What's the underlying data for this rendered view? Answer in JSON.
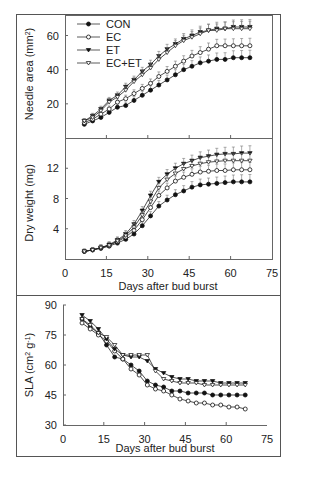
{
  "chart_data": [
    {
      "type": "line",
      "panel": "top",
      "title": "",
      "xlabel": "",
      "ylabel": "Needle area (mm2)",
      "ylabel_text": "Needle area (mm",
      "ylabel_sup": "2",
      "ylabel_close": ")",
      "xlim": [
        0,
        75
      ],
      "ylim": [
        0,
        72
      ],
      "yticks": [
        "20",
        "40",
        "60"
      ],
      "xticks_shown": false,
      "error_bars": true,
      "legend": {
        "position": "upper left",
        "entries": [
          "CON",
          "EC",
          "ET",
          "EC+ET"
        ]
      },
      "x": [
        7,
        10,
        13,
        16,
        19,
        22,
        25,
        28,
        31,
        34,
        37,
        40,
        43,
        46,
        49,
        52,
        55,
        58,
        61,
        64,
        67
      ],
      "series": [
        {
          "name": "CON",
          "marker": "filled-circle",
          "values": [
            8,
            10,
            12,
            15,
            18,
            19,
            22,
            25,
            28,
            31,
            34,
            37,
            40,
            42,
            44,
            45,
            46,
            46,
            47,
            47,
            47
          ]
        },
        {
          "name": "EC",
          "marker": "open-circle",
          "values": [
            9,
            11,
            14,
            17,
            21,
            23,
            26,
            29,
            32,
            36,
            39,
            42,
            45,
            48,
            50,
            52,
            54,
            54,
            54,
            54,
            54
          ]
        },
        {
          "name": "ET",
          "marker": "filled-triangle",
          "values": [
            10,
            13,
            17,
            22,
            25,
            30,
            34,
            39,
            43,
            48,
            52,
            55,
            58,
            60,
            62,
            63,
            64,
            64,
            65,
            65,
            65
          ]
        },
        {
          "name": "EC+ET",
          "marker": "open-triangle",
          "values": [
            10,
            12,
            16,
            21,
            24,
            28,
            33,
            37,
            41,
            46,
            50,
            54,
            57,
            59,
            61,
            63,
            63,
            64,
            64,
            64,
            64
          ]
        }
      ]
    },
    {
      "type": "line",
      "panel": "middle",
      "xlabel": "Days after bud burst",
      "ylabel": "Dry weight (mg)",
      "xlim": [
        0,
        75
      ],
      "ylim": [
        0,
        16
      ],
      "xticks": [
        "0",
        "15",
        "30",
        "45",
        "60",
        "75"
      ],
      "yticks": [
        "4",
        "8",
        "12"
      ],
      "error_bars": true,
      "x": [
        7,
        10,
        13,
        16,
        19,
        22,
        25,
        28,
        31,
        34,
        37,
        40,
        43,
        46,
        49,
        52,
        55,
        58,
        61,
        64,
        67
      ],
      "series": [
        {
          "name": "CON",
          "values": [
            1.0,
            1.2,
            1.4,
            1.7,
            2.1,
            2.6,
            3.3,
            4.4,
            5.7,
            7.0,
            7.8,
            8.5,
            9.0,
            9.5,
            9.8,
            9.9,
            10.0,
            10.1,
            10.2,
            10.2,
            10.2
          ]
        },
        {
          "name": "EC",
          "values": [
            1.0,
            1.2,
            1.5,
            1.8,
            2.3,
            2.9,
            3.8,
            5.2,
            6.8,
            8.4,
            9.4,
            10.3,
            10.8,
            11.2,
            11.5,
            11.6,
            11.7,
            11.7,
            11.8,
            11.8,
            11.8
          ]
        },
        {
          "name": "ET",
          "values": [
            1.0,
            1.2,
            1.5,
            1.9,
            2.5,
            3.3,
            4.6,
            6.4,
            8.4,
            10.2,
            11.2,
            12.0,
            12.6,
            13.0,
            13.4,
            13.6,
            13.8,
            13.9,
            13.9,
            14.0,
            14.0
          ]
        },
        {
          "name": "EC+ET",
          "values": [
            1.0,
            1.2,
            1.5,
            1.8,
            2.4,
            3.1,
            4.2,
            5.8,
            7.6,
            9.4,
            10.5,
            11.3,
            11.9,
            12.3,
            12.6,
            12.8,
            12.9,
            13.0,
            13.0,
            13.0,
            13.0
          ]
        }
      ]
    },
    {
      "type": "line",
      "panel": "bottom",
      "xlabel": "Days after bud burst",
      "ylabel": "SLA (cm2 g-1)",
      "ylabel_parts": {
        "pre": "SLA (cm",
        "sup1": "2",
        "mid": " g",
        "sup2": "-1",
        "post": ")"
      },
      "xlim": [
        0,
        75
      ],
      "ylim": [
        30,
        90
      ],
      "xticks": [
        "0",
        "15",
        "30",
        "45",
        "60",
        "75"
      ],
      "yticks": [
        "30",
        "45",
        "60",
        "75",
        "90"
      ],
      "error_bars": false,
      "x": [
        7,
        10,
        13,
        16,
        19,
        22,
        25,
        28,
        31,
        34,
        37,
        40,
        43,
        46,
        49,
        52,
        55,
        58,
        61,
        64,
        67
      ],
      "series": [
        {
          "name": "CON",
          "values": [
            83,
            79,
            76,
            70,
            64,
            63,
            60,
            57,
            52,
            50,
            49,
            47,
            47,
            46,
            46,
            46,
            45,
            45,
            45,
            45,
            45
          ]
        },
        {
          "name": "EC",
          "values": [
            81,
            78,
            75,
            72,
            67,
            63,
            58,
            55,
            50,
            48,
            47,
            45,
            43,
            42,
            41,
            41,
            40,
            40,
            39,
            39,
            38
          ]
        },
        {
          "name": "ET",
          "values": [
            85,
            82,
            78,
            73,
            68,
            65,
            64,
            64,
            62,
            58,
            56,
            54,
            53,
            53,
            52,
            52,
            52,
            51,
            51,
            51,
            51
          ]
        },
        {
          "name": "EC+ET",
          "values": [
            83,
            80,
            76,
            74,
            70,
            65,
            65,
            65,
            65,
            57,
            53,
            52,
            51,
            51,
            51,
            50,
            50,
            50,
            50,
            50,
            50
          ]
        }
      ]
    }
  ]
}
